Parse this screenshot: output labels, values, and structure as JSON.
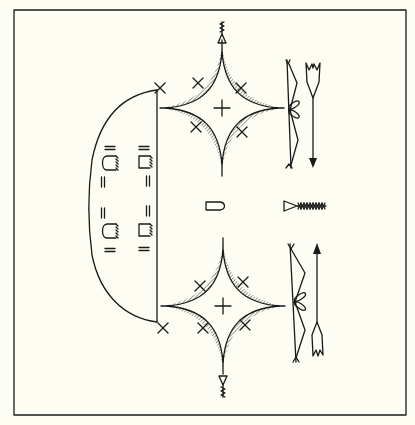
{
  "diagram": {
    "title": "Sand painting: lodge with footprints, stars, bows and arrows",
    "colors": {
      "background": "#fdfdf3",
      "ink": "#1a1a1a"
    },
    "frame": {
      "x": 14,
      "y": 10,
      "width": 392,
      "height": 405
    },
    "elements": [
      {
        "id": "lodge",
        "label": "Lodge / hogan outline",
        "x1": 160,
        "y1": 88,
        "x2": 160,
        "y2": 322
      },
      {
        "id": "footprints",
        "label": "Footprints (4) with double-bar marks",
        "count": 4
      },
      {
        "id": "star-top",
        "label": "Four-pointed star (top)",
        "cx": 222,
        "cy": 108
      },
      {
        "id": "star-bottom",
        "label": "Four-pointed star (bottom)",
        "cx": 222,
        "cy": 305
      },
      {
        "id": "x-marks-top",
        "label": "X marks around top star",
        "count": 4
      },
      {
        "id": "x-marks-bottom",
        "label": "X marks around bottom star",
        "count": 4
      },
      {
        "id": "feather-top",
        "label": "Feathered pendant (top)",
        "cx": 222,
        "cy": 36
      },
      {
        "id": "feather-bottom",
        "label": "Feathered pendant (bottom)",
        "cx": 222,
        "cy": 384
      },
      {
        "id": "bow-top",
        "label": "Bow (top)",
        "x": 289,
        "y1": 62,
        "y2": 168
      },
      {
        "id": "bow-bottom",
        "label": "Bow (bottom)",
        "x": 294,
        "y1": 245,
        "y2": 360
      },
      {
        "id": "arrow-top",
        "label": "Arrow pointing down",
        "x": 313
      },
      {
        "id": "arrow-bottom",
        "label": "Arrow pointing up",
        "x": 318
      },
      {
        "id": "center-bullet",
        "label": "Bullet-shaped object",
        "cx": 214,
        "cy": 207
      },
      {
        "id": "center-arrowhead",
        "label": "Triangle with feathered shaft",
        "cx": 305,
        "cy": 206
      }
    ]
  }
}
